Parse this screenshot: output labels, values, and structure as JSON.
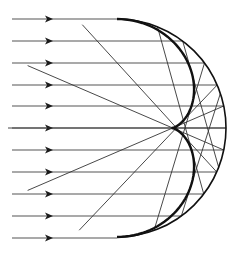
{
  "diagram": {
    "type": "caustic-reflection",
    "colors": {
      "background": "#ffffff",
      "ray": "#555555",
      "arrow": "#1a1a1a",
      "mirror": "#111111",
      "caustic": "#111111",
      "reflected": "#333333"
    },
    "mirror": {
      "cx": 117,
      "cy": 128,
      "r": 109
    },
    "rays": {
      "start_x": 12,
      "arrow_x": 50,
      "y_positions": [
        19,
        41,
        63,
        85,
        106,
        128,
        150,
        172,
        194,
        216,
        238
      ]
    },
    "reflected_ray_count": 11
  }
}
